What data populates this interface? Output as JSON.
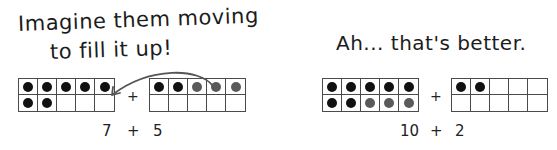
{
  "captions": {
    "left_line1": "Imagine them moving",
    "left_line2": "to fill it up!",
    "right": "Ah... that's better."
  },
  "colors": {
    "original_dot": "#111111",
    "moved_dot": "#5a5a5a",
    "grid_line": "#4a4a4a"
  },
  "frames": [
    {
      "id": "before-left",
      "dots": [
        "b",
        "b",
        "b",
        "b",
        "b",
        "b",
        "b",
        "",
        "",
        ""
      ]
    },
    {
      "id": "before-right",
      "dots": [
        "b",
        "b",
        "g",
        "g",
        "g",
        "",
        "",
        "",
        "",
        ""
      ]
    },
    {
      "id": "after-left",
      "dots": [
        "b",
        "b",
        "b",
        "b",
        "b",
        "b",
        "b",
        "g",
        "g",
        "g"
      ]
    },
    {
      "id": "after-right",
      "dots": [
        "b",
        "b",
        "",
        "",
        "",
        "",
        "",
        "",
        "",
        ""
      ]
    }
  ],
  "equations": {
    "before": {
      "a": "7",
      "op": "+",
      "b": "5"
    },
    "after": {
      "a": "10",
      "op": "+",
      "b": "2"
    }
  },
  "plus_signs": {
    "before": "+",
    "after": "+"
  }
}
